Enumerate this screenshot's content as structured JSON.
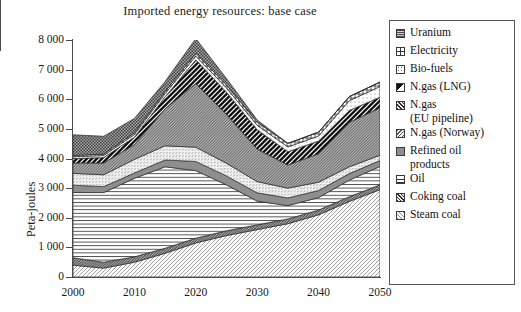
{
  "chart_data": {
    "type": "area",
    "stacked": true,
    "title": "Imported energy resources: base case",
    "xlabel": "",
    "ylabel": "Peta-joules",
    "xlim": [
      2000,
      2050
    ],
    "ylim": [
      0,
      8000
    ],
    "y_ticks": [
      0,
      1000,
      2000,
      3000,
      4000,
      5000,
      6000,
      7000,
      8000
    ],
    "y_tick_labels": [
      "0",
      "1 000",
      "2 000",
      "3 000",
      "4 000",
      "5 000",
      "6 000",
      "7 000",
      "8 000"
    ],
    "x_ticks_major": [
      2000,
      2010,
      2020,
      2030,
      2040,
      2050
    ],
    "x_tick_labels": [
      "2000",
      "2010",
      "2020",
      "2030",
      "2040",
      "2050"
    ],
    "x_ticks_minor": [
      2005,
      2015,
      2025,
      2035,
      2045
    ],
    "grid": false,
    "legend_position": "right",
    "x": [
      2000,
      2005,
      2010,
      2015,
      2020,
      2025,
      2030,
      2035,
      2040,
      2045,
      2050
    ],
    "series": [
      {
        "name": "Steam coal",
        "pattern": "diagonal-hatch-light",
        "color": "#d9d9d9",
        "values": [
          400,
          300,
          500,
          800,
          1150,
          1400,
          1600,
          1800,
          2100,
          2550,
          2950
        ]
      },
      {
        "name": "Coking coal",
        "pattern": "diagonal-hatch-dark",
        "color": "#3a3a3a",
        "values": [
          250,
          200,
          180,
          170,
          160,
          160,
          160,
          160,
          160,
          160,
          160
        ]
      },
      {
        "name": "Oil",
        "pattern": "horizontal-lines",
        "color": "#ffffff",
        "values": [
          2200,
          2350,
          2650,
          2750,
          2280,
          1550,
          800,
          450,
          420,
          560,
          620
        ]
      },
      {
        "name": "Refined oil products",
        "pattern": "solid-grey",
        "color": "#8e8e8e",
        "values": [
          250,
          200,
          180,
          230,
          310,
          300,
          280,
          260,
          240,
          220,
          200
        ]
      },
      {
        "name": "N.gas (Norway)",
        "pattern": "diagonal-fine-light",
        "color": "#efefef",
        "values": [
          400,
          400,
          460,
          480,
          480,
          430,
          380,
          330,
          280,
          230,
          180
        ]
      },
      {
        "name": "N.gas (EU pipeline)",
        "pattern": "diagonal-hatch-mid",
        "color": "#b5b5b5",
        "values": [
          350,
          400,
          500,
          1250,
          2150,
          1650,
          1100,
          780,
          960,
          1500,
          1600
        ]
      },
      {
        "name": "N.gas (LNG)",
        "pattern": "diagonal-half-black",
        "color": "#111111",
        "values": [
          150,
          180,
          250,
          400,
          800,
          750,
          650,
          450,
          430,
          400,
          360
        ]
      },
      {
        "name": "Bio-fuels",
        "pattern": "sparse-dots",
        "color": "#fcfcfc",
        "values": [
          60,
          70,
          90,
          110,
          130,
          140,
          150,
          160,
          170,
          330,
          360
        ]
      },
      {
        "name": "Electricity",
        "pattern": "cross-grid",
        "color": "#ffffff",
        "values": [
          40,
          50,
          60,
          70,
          90,
          100,
          110,
          120,
          130,
          140,
          150
        ]
      },
      {
        "name": "Uranium",
        "pattern": "dense-checker",
        "color": "#6e6e6e",
        "values": [
          700,
          600,
          480,
          340,
          500,
          220,
          70,
          0,
          0,
          0,
          0
        ]
      }
    ],
    "totals": [
      4800,
      4750,
      5350,
      6600,
      8050,
      6700,
      5300,
      4510,
      4890,
      6090,
      6580
    ]
  },
  "legend": {
    "items": [
      {
        "label": "Uranium",
        "swatch": "dense-checker"
      },
      {
        "label": "Electricity",
        "swatch": "cross-grid"
      },
      {
        "label": "Bio-fuels",
        "swatch": "sparse-dots"
      },
      {
        "label": "N.gas (LNG)",
        "swatch": "diagonal-half-black"
      },
      {
        "label": "N.gas\n(EU pipeline)",
        "swatch": "diagonal-hatch-mid"
      },
      {
        "label": "N.gas (Norway)",
        "swatch": "diagonal-fine-light"
      },
      {
        "label": "Refined oil\nproducts",
        "swatch": "solid-grey"
      },
      {
        "label": "Oil",
        "swatch": "horizontal-lines"
      },
      {
        "label": "Coking coal",
        "swatch": "diagonal-hatch-dark"
      },
      {
        "label": "Steam coal",
        "swatch": "diagonal-hatch-light"
      }
    ]
  }
}
